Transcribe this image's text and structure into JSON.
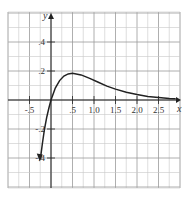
{
  "chart_data": {
    "type": "line",
    "title": "",
    "xlabel": "x",
    "ylabel": "y",
    "xlim": [
      -0.95,
      3.0
    ],
    "ylim": [
      -0.6,
      0.6
    ],
    "grid": true,
    "x_ticks": [
      {
        "value": -0.5,
        "label": "-.5"
      },
      {
        "value": 0.5,
        "label": ".5"
      },
      {
        "value": 1.0,
        "label": "1.0"
      },
      {
        "value": 1.5,
        "label": "1.5"
      },
      {
        "value": 2.0,
        "label": "2.0"
      },
      {
        "value": 2.5,
        "label": "2.5"
      }
    ],
    "y_ticks": [
      {
        "value": 0.4,
        "label": ".4"
      },
      {
        "value": 0.2,
        "label": ".2"
      },
      {
        "value": -0.2,
        "label": "-.2"
      },
      {
        "value": -0.4,
        "label": "-.4"
      }
    ],
    "series": [
      {
        "name": "curve",
        "x": [
          -0.25,
          -0.2,
          -0.15,
          -0.1,
          -0.05,
          0,
          0.1,
          0.2,
          0.3,
          0.4,
          0.5,
          0.7,
          0.9,
          1.1,
          1.3,
          1.5,
          1.75,
          2.0,
          2.25,
          2.5,
          2.75,
          2.9
        ],
        "y": [
          -0.41,
          -0.3,
          -0.2,
          -0.12,
          -0.055,
          0,
          0.082,
          0.134,
          0.165,
          0.18,
          0.184,
          0.173,
          0.149,
          0.122,
          0.096,
          0.075,
          0.053,
          0.037,
          0.025,
          0.017,
          0.011,
          0.009
        ]
      }
    ],
    "annotations": [
      "arrow at lower-left end of curve",
      "arrow at right end of curve",
      "arrow on y-axis top",
      "arrow on x-axis right"
    ]
  }
}
